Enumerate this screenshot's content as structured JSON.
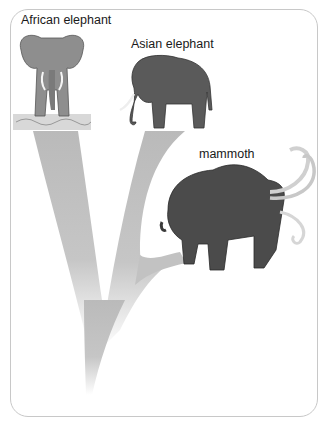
{
  "diagram": {
    "type": "evolutionary-tree",
    "labels": {
      "african": "African elephant",
      "asian": "Asian elephant",
      "mammoth": "mammoth"
    },
    "colors": {
      "frame_border": "#c8c8c8",
      "branch": "#bdbdbd",
      "animal": "#555555"
    },
    "tree": {
      "root": "common ancestor (unlabeled)",
      "branches": [
        {
          "from": "root",
          "to": "African elephant"
        },
        {
          "from": "root",
          "to": "Asian-mammoth split"
        },
        {
          "from": "Asian-mammoth split",
          "to": "Asian elephant"
        },
        {
          "from": "Asian-mammoth split",
          "to": "mammoth"
        }
      ]
    }
  }
}
